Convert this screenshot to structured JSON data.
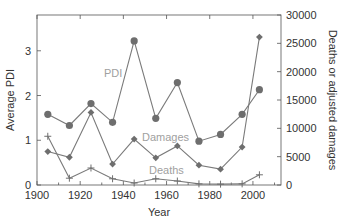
{
  "chart_data": {
    "type": "line",
    "title": "",
    "xlabel": "Year",
    "ylabel_left": "Average PDI",
    "ylabel_right": "Deaths or adjusted damages",
    "xlim": [
      1900,
      2013
    ],
    "ylim_left": [
      0,
      3.8
    ],
    "ylim_right": [
      0,
      30000
    ],
    "xticks": [
      1900,
      1920,
      1940,
      1960,
      1980,
      2000
    ],
    "xtick_labels": [
      "1900",
      "1920",
      "1940",
      "1960",
      "1980",
      "2000"
    ],
    "yticks_left": [
      0,
      1,
      2,
      3
    ],
    "ytick_labels_left": [
      "0",
      "1",
      "2",
      "3"
    ],
    "yticks_right": [
      0,
      5000,
      10000,
      15000,
      20000,
      25000,
      30000
    ],
    "ytick_labels_right": [
      "0",
      "5000",
      "10000",
      "15000",
      "20000",
      "25000",
      "30000"
    ],
    "grid": false,
    "legend": "inline labels",
    "x": [
      1905,
      1915,
      1925,
      1935,
      1945,
      1955,
      1965,
      1975,
      1985,
      1995,
      2003
    ],
    "series": [
      {
        "name": "PDI",
        "axis": "left",
        "marker": "circle",
        "label": "PDI",
        "values": [
          1.58,
          1.33,
          1.82,
          1.4,
          3.22,
          1.49,
          2.29,
          0.98,
          1.13,
          1.58,
          2.13
        ]
      },
      {
        "name": "Damages",
        "axis": "right",
        "marker": "diamond",
        "label": "Damages",
        "values": [
          5900,
          4900,
          12800,
          3700,
          8100,
          4800,
          6900,
          3500,
          2800,
          6700,
          26100
        ]
      },
      {
        "name": "Deaths",
        "axis": "right",
        "marker": "plus",
        "label": "Deaths",
        "values": [
          8600,
          1200,
          3000,
          1100,
          350,
          1100,
          700,
          200,
          150,
          200,
          1800
        ]
      }
    ],
    "colors": {
      "lines": "#7a7a7a",
      "markers": "#6e6e6e",
      "labels": "#a0a0a0",
      "axes": "#555555",
      "text": "#333333"
    }
  }
}
